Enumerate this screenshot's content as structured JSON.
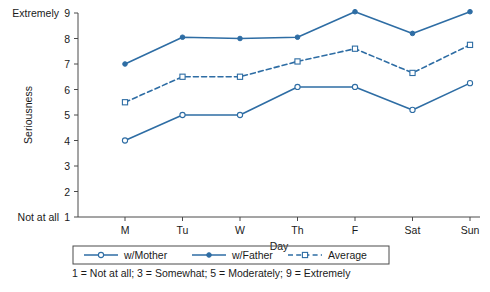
{
  "chart_data": {
    "type": "line",
    "title": "",
    "xlabel": "Day",
    "ylabel": "Seriousness",
    "categories": [
      "M",
      "Tu",
      "W",
      "Th",
      "F",
      "Sat",
      "Sun"
    ],
    "ylim": [
      1,
      9
    ],
    "yticks": [
      1,
      2,
      3,
      4,
      5,
      6,
      7,
      8,
      9
    ],
    "ytick_labels": [
      "1",
      "2",
      "3",
      "4",
      "5",
      "6",
      "7",
      "8",
      "9"
    ],
    "y_axis_low_anchor": "Not at all",
    "y_axis_high_anchor": "Extremely",
    "grid": false,
    "legend_position": "bottom",
    "series": [
      {
        "name": "w/Mother",
        "values": [
          4.0,
          5.0,
          5.0,
          6.1,
          6.1,
          5.2,
          6.25
        ],
        "marker": "open-circle",
        "dash": "solid",
        "color": "#2E6DA4"
      },
      {
        "name": "w/Father",
        "values": [
          7.0,
          8.05,
          8.0,
          8.05,
          9.05,
          8.2,
          9.05
        ],
        "marker": "filled-circle",
        "dash": "solid",
        "color": "#2E6DA4"
      },
      {
        "name": "Average",
        "values": [
          5.5,
          6.5,
          6.5,
          7.1,
          7.6,
          6.65,
          7.75
        ],
        "marker": "open-square",
        "dash": "dashed",
        "color": "#2E6DA4"
      }
    ],
    "footnote": "1 = Not at all; 3 = Somewhat; 5 = Moderately; 9 = Extremely",
    "accent_color": "#2E6DA4",
    "axis_color": "#4a4a4a"
  }
}
